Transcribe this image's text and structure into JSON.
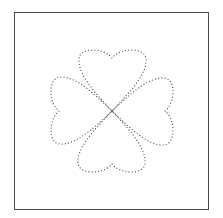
{
  "figure": {
    "shape": "four-leaf-clover",
    "leaves": [
      "top-heart",
      "right-heart",
      "bottom-heart",
      "left-heart"
    ],
    "line_style": "dotted",
    "colors": {
      "frame": "#4a4a4a",
      "dots": "#555555",
      "background": "#ffffff"
    }
  }
}
